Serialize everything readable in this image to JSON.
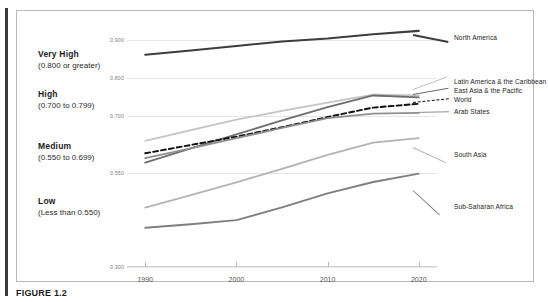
{
  "caption": "FIGURE 1.2",
  "categories": [
    {
      "title": "Very High",
      "range": "(0.800 or greater)",
      "top": 38
    },
    {
      "title": "High",
      "range": "(0.700 to 0.799)",
      "top": 78
    },
    {
      "title": "Medium",
      "range": "(0.550 to 0.699)",
      "top": 130
    },
    {
      "title": "Low",
      "range": "(Less than 0.550)",
      "top": 185
    }
  ],
  "chart_data": {
    "type": "line",
    "title": "",
    "xlabel": "",
    "ylabel": "",
    "x": [
      1990,
      1995,
      2000,
      2005,
      2010,
      2015,
      2020
    ],
    "xlim": [
      1988,
      2022
    ],
    "ylim": [
      0.3,
      0.93
    ],
    "xticks": [
      "1990",
      "2000",
      "2010",
      "2020"
    ],
    "yticks": [
      "0.900",
      "0.800",
      "0.700",
      "0.550",
      "0.300"
    ],
    "ytickvalues": [
      0.9,
      0.8,
      0.7,
      0.55,
      0.3
    ],
    "grid": true,
    "legend": "right-inline",
    "series": [
      {
        "name": "North America",
        "values": [
          0.862,
          0.873,
          0.885,
          0.897,
          0.905,
          0.916,
          0.925
        ],
        "color": "#3d3d3d",
        "width": 2.1,
        "dash": "none",
        "label_y": 27
      },
      {
        "name": "Latin America & the Caribbean",
        "values": [
          0.634,
          0.662,
          0.69,
          0.713,
          0.735,
          0.756,
          0.754
        ],
        "color": "#c4c4c4",
        "width": 1.8,
        "dash": "none",
        "label_y": 71
      },
      {
        "name": "East Asia & the Pacific",
        "values": [
          0.576,
          0.614,
          0.651,
          0.688,
          0.723,
          0.754,
          0.749
        ],
        "color": "#6e6e6e",
        "width": 1.8,
        "dash": "none",
        "label_y": 80
      },
      {
        "name": "World",
        "values": [
          0.601,
          0.623,
          0.645,
          0.67,
          0.697,
          0.722,
          0.732
        ],
        "color": "#111111",
        "width": 1.9,
        "dash": "dashed",
        "label_y": 89
      },
      {
        "name": "Arab States",
        "values": [
          0.588,
          0.614,
          0.641,
          0.668,
          0.694,
          0.706,
          0.708
        ],
        "color": "#8e8e8e",
        "width": 1.8,
        "dash": "none",
        "label_y": 101
      },
      {
        "name": "South Asia",
        "values": [
          0.457,
          0.49,
          0.524,
          0.56,
          0.597,
          0.629,
          0.641
        ],
        "color": "#b3b3b3",
        "width": 1.8,
        "dash": "none",
        "label_y": 144
      },
      {
        "name": "Sub-Saharan Africa",
        "values": [
          0.404,
          0.413,
          0.424,
          0.458,
          0.495,
          0.525,
          0.547
        ],
        "color": "#7f7f7f",
        "width": 1.9,
        "dash": "none",
        "label_y": 196
      }
    ]
  }
}
